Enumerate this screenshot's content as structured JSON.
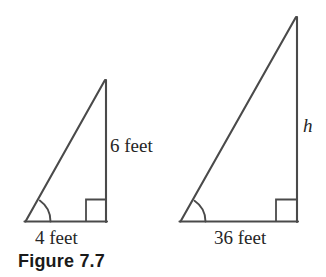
{
  "figure": {
    "caption": "Figure 7.7",
    "background_color": "#ffffff",
    "stroke_color": "#4a4a4a",
    "text_color": "#252525",
    "shapes": [
      {
        "name": "small-right-triangle",
        "legs": {
          "base_label": "4 feet",
          "height_label": "6 feet"
        },
        "marks": {
          "angle_arc": "acute-angle-arc",
          "right_angle": "right-angle-square"
        }
      },
      {
        "name": "large-right-triangle",
        "legs": {
          "base_label": "36 feet",
          "height_label": "h"
        },
        "marks": {
          "angle_arc": "acute-angle-arc",
          "right_angle": "right-angle-square"
        }
      }
    ]
  },
  "labels": {
    "small_height": "6 feet",
    "small_base": "4 feet",
    "large_height": "h",
    "large_base": "36 feet"
  }
}
